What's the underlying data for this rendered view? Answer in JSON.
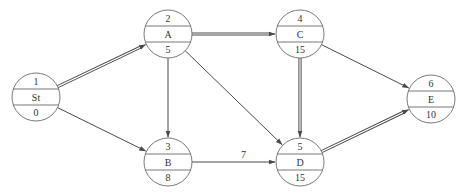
{
  "diagram": {
    "type": "activity-on-node network",
    "colors": {
      "stroke": "#4a4a4a",
      "text": "#333333",
      "background": "#ffffff"
    },
    "nodes": [
      {
        "id": "St",
        "number": "1",
        "label": "St",
        "duration": "0",
        "x": 36,
        "y": 97
      },
      {
        "id": "A",
        "number": "2",
        "label": "A",
        "duration": "5",
        "x": 168,
        "y": 34
      },
      {
        "id": "B",
        "number": "3",
        "label": "B",
        "duration": "8",
        "x": 168,
        "y": 162
      },
      {
        "id": "C",
        "number": "4",
        "label": "C",
        "duration": "15",
        "x": 300,
        "y": 34
      },
      {
        "id": "D",
        "number": "5",
        "label": "D",
        "duration": "15",
        "x": 300,
        "y": 162
      },
      {
        "id": "E",
        "number": "6",
        "label": "E",
        "duration": "10",
        "x": 431,
        "y": 99
      }
    ],
    "edges": [
      {
        "from": "St",
        "to": "A",
        "critical": true,
        "label": ""
      },
      {
        "from": "St",
        "to": "B",
        "critical": false,
        "label": ""
      },
      {
        "from": "A",
        "to": "C",
        "critical": true,
        "label": ""
      },
      {
        "from": "A",
        "to": "B",
        "critical": false,
        "label": ""
      },
      {
        "from": "A",
        "to": "D",
        "critical": false,
        "label": ""
      },
      {
        "from": "B",
        "to": "D",
        "critical": false,
        "label": "7"
      },
      {
        "from": "C",
        "to": "D",
        "critical": true,
        "label": ""
      },
      {
        "from": "C",
        "to": "E",
        "critical": false,
        "label": ""
      },
      {
        "from": "D",
        "to": "E",
        "critical": true,
        "label": ""
      }
    ]
  }
}
